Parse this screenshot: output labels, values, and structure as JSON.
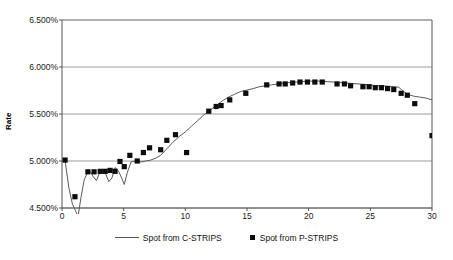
{
  "chart_data": {
    "type": "scatter",
    "title": "",
    "xlabel": "",
    "ylabel": "Rate",
    "xlim": [
      0,
      30
    ],
    "ylim": [
      4.5,
      6.5
    ],
    "ytick_labels": [
      "6.500%",
      "6.000%",
      "5.500%",
      "5.000%",
      "4.500%"
    ],
    "ytick_values": [
      6.5,
      6.0,
      5.5,
      5.0,
      4.5
    ],
    "xtick_labels": [
      "0",
      "5",
      "10",
      "15",
      "20",
      "25",
      "30"
    ],
    "xtick_values": [
      0,
      5,
      10,
      15,
      20,
      25,
      30
    ],
    "grid": "horizontal",
    "legend_position": "bottom-center",
    "series": [
      {
        "name": "Spot from C-STRIPS",
        "type": "line",
        "color": "#5a5a5a",
        "points": [
          [
            0.25,
            5.005
          ],
          [
            0.55,
            4.72
          ],
          [
            0.85,
            4.54
          ],
          [
            1.1,
            4.47
          ],
          [
            1.3,
            4.41
          ],
          [
            1.55,
            4.62
          ],
          [
            1.8,
            4.8
          ],
          [
            2.05,
            4.87
          ],
          [
            2.3,
            4.885
          ],
          [
            2.55,
            4.83
          ],
          [
            2.8,
            4.79
          ],
          [
            3.05,
            4.88
          ],
          [
            3.3,
            4.9
          ],
          [
            3.55,
            4.86
          ],
          [
            3.8,
            4.78
          ],
          [
            4.05,
            4.82
          ],
          [
            4.3,
            4.93
          ],
          [
            4.55,
            4.9
          ],
          [
            4.8,
            4.83
          ],
          [
            5.05,
            4.75
          ],
          [
            5.3,
            4.88
          ],
          [
            5.6,
            4.99
          ],
          [
            6.0,
            5.0
          ],
          [
            6.4,
            4.99
          ],
          [
            6.8,
            5.0
          ],
          [
            7.2,
            5.01
          ],
          [
            7.6,
            5.03
          ],
          [
            8.0,
            5.06
          ],
          [
            8.5,
            5.13
          ],
          [
            9.0,
            5.2
          ],
          [
            9.5,
            5.26
          ],
          [
            10.0,
            5.31
          ],
          [
            10.5,
            5.37
          ],
          [
            11.0,
            5.43
          ],
          [
            11.5,
            5.49
          ],
          [
            12.0,
            5.54
          ],
          [
            12.5,
            5.59
          ],
          [
            13.0,
            5.64
          ],
          [
            13.5,
            5.68
          ],
          [
            14.0,
            5.71
          ],
          [
            14.5,
            5.74
          ],
          [
            15.0,
            5.755
          ],
          [
            15.5,
            5.77
          ],
          [
            16.0,
            5.79
          ],
          [
            16.5,
            5.8
          ],
          [
            17.0,
            5.81
          ],
          [
            17.5,
            5.82
          ],
          [
            18.0,
            5.83
          ],
          [
            18.5,
            5.835
          ],
          [
            19.0,
            5.84
          ],
          [
            19.5,
            5.845
          ],
          [
            20.0,
            5.85
          ],
          [
            20.5,
            5.85
          ],
          [
            21.0,
            5.85
          ],
          [
            21.5,
            5.845
          ],
          [
            22.0,
            5.84
          ],
          [
            22.5,
            5.835
          ],
          [
            23.0,
            5.83
          ],
          [
            23.5,
            5.825
          ],
          [
            24.0,
            5.82
          ],
          [
            24.5,
            5.815
          ],
          [
            25.0,
            5.81
          ],
          [
            25.5,
            5.8
          ],
          [
            26.0,
            5.8
          ],
          [
            26.5,
            5.795
          ],
          [
            27.0,
            5.79
          ],
          [
            27.3,
            5.785
          ],
          [
            27.6,
            5.75
          ],
          [
            28.0,
            5.71
          ],
          [
            28.5,
            5.69
          ],
          [
            29.0,
            5.68
          ],
          [
            29.5,
            5.67
          ],
          [
            30.0,
            5.65
          ]
        ]
      },
      {
        "name": "Spot from P-STRIPS",
        "type": "scatter",
        "color": "#0d0d0d",
        "marker": "square",
        "points": [
          [
            0.25,
            5.01
          ],
          [
            1.05,
            4.62
          ],
          [
            2.1,
            4.885
          ],
          [
            2.6,
            4.885
          ],
          [
            3.1,
            4.89
          ],
          [
            3.5,
            4.89
          ],
          [
            3.9,
            4.9
          ],
          [
            4.3,
            4.89
          ],
          [
            4.7,
            4.995
          ],
          [
            5.05,
            4.94
          ],
          [
            5.5,
            5.06
          ],
          [
            6.1,
            5.0
          ],
          [
            6.6,
            5.09
          ],
          [
            7.1,
            5.14
          ],
          [
            8.0,
            5.12
          ],
          [
            8.5,
            5.22
          ],
          [
            9.2,
            5.28
          ],
          [
            10.1,
            5.09
          ],
          [
            11.9,
            5.53
          ],
          [
            12.5,
            5.58
          ],
          [
            12.9,
            5.59
          ],
          [
            13.6,
            5.65
          ],
          [
            14.9,
            5.72
          ],
          [
            16.6,
            5.81
          ],
          [
            17.6,
            5.82
          ],
          [
            18.1,
            5.82
          ],
          [
            18.7,
            5.83
          ],
          [
            19.3,
            5.84
          ],
          [
            19.9,
            5.84
          ],
          [
            20.5,
            5.84
          ],
          [
            21.1,
            5.84
          ],
          [
            22.3,
            5.82
          ],
          [
            22.9,
            5.82
          ],
          [
            23.4,
            5.8
          ],
          [
            24.4,
            5.79
          ],
          [
            24.9,
            5.79
          ],
          [
            25.4,
            5.78
          ],
          [
            25.9,
            5.78
          ],
          [
            26.4,
            5.77
          ],
          [
            26.9,
            5.76
          ],
          [
            27.5,
            5.72
          ],
          [
            28.0,
            5.7
          ],
          [
            28.6,
            5.61
          ],
          [
            30.0,
            5.27
          ]
        ]
      }
    ]
  },
  "legend": {
    "entries": [
      {
        "label": "Spot from C-STRIPS",
        "swatch": "line-swatch"
      },
      {
        "label": "Spot from P-STRIPS",
        "swatch": "square-swatch"
      }
    ]
  },
  "colors": {
    "line": "#5a5a5a",
    "marker": "#0d0d0d",
    "grid": "#808080",
    "axis": "#555555",
    "text": "#111111",
    "background": "#ffffff"
  }
}
